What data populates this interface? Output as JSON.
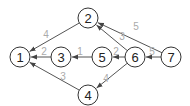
{
  "graph": {
    "directed": true,
    "nodes": [
      {
        "id": "1",
        "label": "1",
        "x": 20,
        "y": 57
      },
      {
        "id": "2",
        "label": "2",
        "x": 88,
        "y": 18
      },
      {
        "id": "3",
        "label": "3",
        "x": 61,
        "y": 57
      },
      {
        "id": "4",
        "label": "4",
        "x": 88,
        "y": 95
      },
      {
        "id": "5",
        "label": "5",
        "x": 102,
        "y": 57
      },
      {
        "id": "6",
        "label": "6",
        "x": 135,
        "y": 57
      },
      {
        "id": "7",
        "label": "7",
        "x": 171,
        "y": 57
      }
    ],
    "edges": [
      {
        "from": "2",
        "to": "1",
        "weight": "4",
        "lx": 46,
        "ly": 34
      },
      {
        "from": "3",
        "to": "1",
        "weight": "2",
        "lx": 44,
        "ly": 51
      },
      {
        "from": "4",
        "to": "1",
        "weight": "3",
        "lx": 63,
        "ly": 76
      },
      {
        "from": "5",
        "to": "3",
        "weight": "1",
        "lx": 80,
        "ly": 51
      },
      {
        "from": "6",
        "to": "5",
        "weight": "2",
        "lx": 116,
        "ly": 51
      },
      {
        "from": "6",
        "to": "2",
        "weight": "3",
        "lx": 122,
        "ly": 36
      },
      {
        "from": "6",
        "to": "4",
        "weight": "4",
        "lx": 106,
        "ly": 78
      },
      {
        "from": "7",
        "to": "6",
        "weight": "5",
        "lx": 152,
        "ly": 51
      },
      {
        "from": "7",
        "to": "2",
        "weight": "5",
        "lx": 136,
        "ly": 26
      }
    ]
  },
  "style": {
    "node_radius": 10,
    "edge_color": "#555555",
    "label_color": "#aaaaaa"
  }
}
